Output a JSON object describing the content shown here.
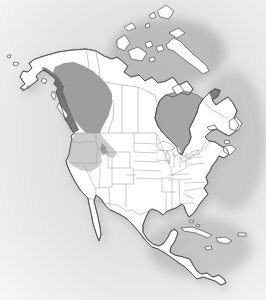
{
  "map": {
    "type": "species-range-map",
    "region": "North America",
    "shaded_ranges": [
      {
        "id": "range-dark-coastal",
        "tone": "dark",
        "areas": [
          "south-coastal-alaska",
          "alaska-panhandle",
          "coastal-british-columbia"
        ]
      },
      {
        "id": "range-medium-interior",
        "tone": "medium",
        "areas": [
          "interior-british-columbia",
          "southern-yukon"
        ]
      },
      {
        "id": "range-medium-idaho",
        "tone": "medium",
        "areas": [
          "central-idaho"
        ]
      },
      {
        "id": "range-light-northwest",
        "tone": "light",
        "areas": [
          "washington",
          "oregon",
          "northern-idaho",
          "western-montana",
          "northwest-wyoming",
          "northeast-california-edge"
        ]
      }
    ],
    "water_bodies": [
      "hudson-bay",
      "james-bay",
      "ungava-bay",
      "great-lakes",
      "gulf-of-mexico",
      "pacific-ocean",
      "atlantic-ocean",
      "gulf-of-california"
    ],
    "visible_regions": [
      "alaska",
      "canada",
      "united-states",
      "mexico",
      "central-america",
      "caribbean-islands",
      "arctic-archipelago",
      "greenland-absent",
      "newfoundland",
      "vancouver-island",
      "baja-california",
      "yucatan",
      "florida",
      "cuba",
      "hispaniola",
      "puerto-rico",
      "jamaica",
      "bahamas"
    ]
  },
  "colors": {
    "background_edge": "#f8f8f8",
    "background_haze": "#dcdcdc",
    "shadow": "#9e9e9e",
    "land": "#ffffff",
    "coast_outline": "#4f4f4f",
    "inner_border": "#9b9b9b",
    "hudson_bay": "#a6a6a6",
    "ungava_bay": "#6e6e6e",
    "range_dark": "#6e6e6e",
    "range_medium": "#949494",
    "range_light": "#cbcbcb"
  }
}
